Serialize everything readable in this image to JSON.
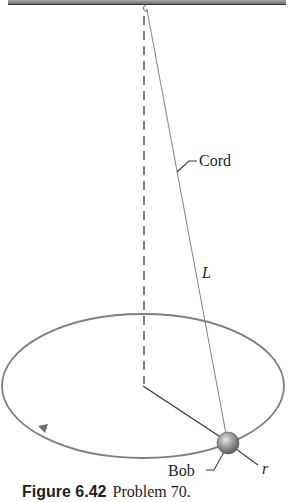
{
  "figure": {
    "labels": {
      "cord": "Cord",
      "length": "L",
      "bob": "Bob",
      "radius": "r"
    },
    "caption": {
      "number": "Figure 6.42",
      "text": "Problem 70."
    },
    "colors": {
      "ceiling": "#6d6e71",
      "ceiling_edge": "#3a3a3c",
      "orbit": "#7f7f82",
      "cord": "#8a8a8d",
      "dashed_axis": "#3a3a3c",
      "radius_line": "#3a3a3c",
      "bob_fill": "#9a9a9c",
      "text": "#231f20"
    }
  }
}
